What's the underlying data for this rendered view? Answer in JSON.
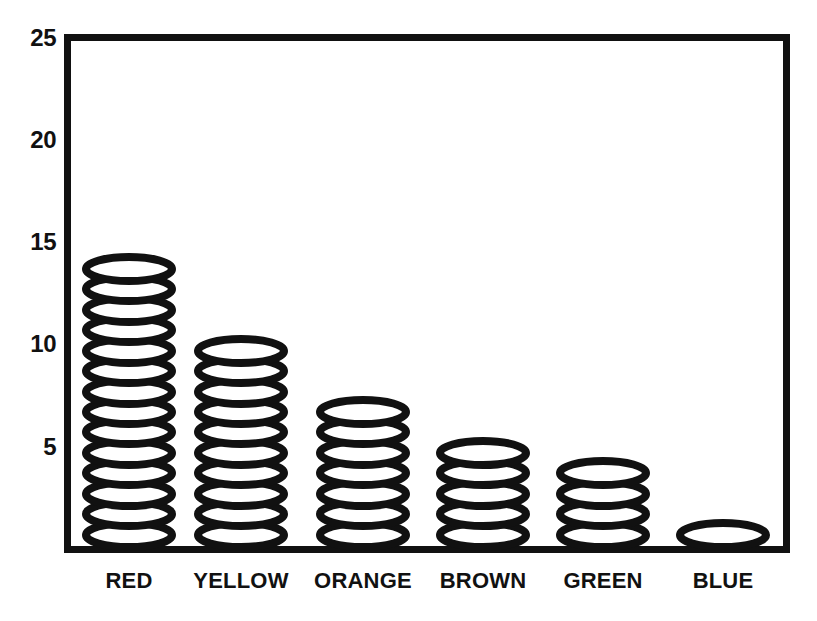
{
  "chart_data": {
    "type": "bar",
    "title": "",
    "subtitle": "",
    "xlabel": "",
    "ylabel": "",
    "categories": [
      "RED",
      "YELLOW",
      "ORANGE",
      "BROWN",
      "GREEN",
      "BLUE"
    ],
    "values": [
      14,
      10,
      7,
      5,
      4,
      1
    ],
    "ylim": [
      0,
      25
    ],
    "ytick_labels": [
      "25",
      "20",
      "15",
      "10",
      "5"
    ],
    "ytick_values": [
      25,
      20,
      15,
      10,
      5
    ],
    "grid": false,
    "legend": false,
    "legend_position": "none",
    "marker_style": "stacked-disc-pictogram",
    "colors": {
      "ink": "#111111",
      "background": "#ffffff"
    }
  },
  "axis": {
    "y_ticks": [
      {
        "label": "25",
        "value": 25
      },
      {
        "label": "20",
        "value": 20
      },
      {
        "label": "15",
        "value": 15
      },
      {
        "label": "10",
        "value": 10
      },
      {
        "label": "5",
        "value": 5
      }
    ],
    "x_ticks": [
      {
        "label": "RED",
        "value": 14
      },
      {
        "label": "YELLOW",
        "value": 10
      },
      {
        "label": "ORANGE",
        "value": 7
      },
      {
        "label": "BROWN",
        "value": 5
      },
      {
        "label": "GREEN",
        "value": 4
      },
      {
        "label": "BLUE",
        "value": 1
      }
    ]
  }
}
